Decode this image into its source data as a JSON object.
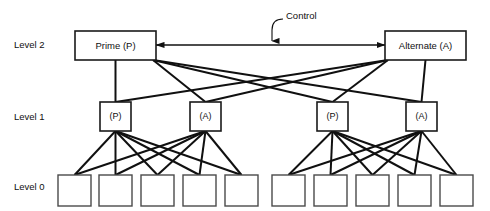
{
  "diagram": {
    "colors": {
      "line": "#101010",
      "box_stroke": "#1a1a1a",
      "leaf_stroke": "#4a4a4a",
      "background": "#ffffff",
      "text": "#101010"
    },
    "level_labels": [
      {
        "id": "level-2",
        "text": "Level 2",
        "x": 14,
        "y": 45
      },
      {
        "id": "level-1",
        "text": "Level 1",
        "x": 14,
        "y": 117
      },
      {
        "id": "level-0",
        "text": "Level 0",
        "x": 14,
        "y": 187
      }
    ],
    "annotations": [
      {
        "id": "control",
        "text": "Control",
        "x": 286,
        "y": 16
      }
    ],
    "level2_nodes": [
      {
        "id": "prime",
        "label": "Prime (P)",
        "x": 75,
        "y": 31,
        "w": 81,
        "h": 29
      },
      {
        "id": "alternate",
        "label": "Alternate (A)",
        "x": 385,
        "y": 31,
        "w": 81,
        "h": 29
      }
    ],
    "level1_nodes": [
      {
        "id": "l1-p-left",
        "label": "(P)",
        "x": 100,
        "y": 102,
        "w": 31,
        "h": 29
      },
      {
        "id": "l1-a-left",
        "label": "(A)",
        "x": 190,
        "y": 102,
        "w": 31,
        "h": 29
      },
      {
        "id": "l1-p-right",
        "label": "(P)",
        "x": 317,
        "y": 102,
        "w": 31,
        "h": 29
      },
      {
        "id": "l1-a-right",
        "label": "(A)",
        "x": 406,
        "y": 102,
        "w": 31,
        "h": 29
      }
    ],
    "level0_nodes": [
      {
        "id": "l0-1",
        "x": 58,
        "y": 175,
        "w": 33,
        "h": 31
      },
      {
        "id": "l0-2",
        "x": 99,
        "y": 175,
        "w": 33,
        "h": 31
      },
      {
        "id": "l0-3",
        "x": 141,
        "y": 175,
        "w": 33,
        "h": 31
      },
      {
        "id": "l0-4",
        "x": 183,
        "y": 175,
        "w": 33,
        "h": 31
      },
      {
        "id": "l0-5",
        "x": 225,
        "y": 175,
        "w": 33,
        "h": 31
      },
      {
        "id": "l0-6",
        "x": 272,
        "y": 175,
        "w": 33,
        "h": 31
      },
      {
        "id": "l0-7",
        "x": 314,
        "y": 175,
        "w": 33,
        "h": 31
      },
      {
        "id": "l0-8",
        "x": 356,
        "y": 175,
        "w": 33,
        "h": 31
      },
      {
        "id": "l0-9",
        "x": 398,
        "y": 175,
        "w": 33,
        "h": 31
      },
      {
        "id": "l0-10",
        "x": 440,
        "y": 175,
        "w": 33,
        "h": 31
      }
    ],
    "control_link": {
      "id": "control-bus",
      "x1": 156,
      "x2": 385,
      "y": 45,
      "double_headed": true
    },
    "control_leader": {
      "id": "control-leader",
      "path": "M 283 19 C 276 19 272 23 272 30 L 272 41",
      "arrow_tip": {
        "x": 272,
        "y": 45
      }
    },
    "edges_l2_l1": [
      {
        "from": "prime",
        "to": "l1-p-left"
      },
      {
        "from": "prime",
        "to": "l1-a-left"
      },
      {
        "from": "prime",
        "to": "l1-p-right"
      },
      {
        "from": "prime",
        "to": "l1-a-right"
      },
      {
        "from": "alternate",
        "to": "l1-p-left"
      },
      {
        "from": "alternate",
        "to": "l1-a-left"
      },
      {
        "from": "alternate",
        "to": "l1-p-right"
      },
      {
        "from": "alternate",
        "to": "l1-a-right"
      }
    ],
    "edges_l1_l0": [
      {
        "from": "l1-p-left",
        "to": "l0-1"
      },
      {
        "from": "l1-p-left",
        "to": "l0-2"
      },
      {
        "from": "l1-p-left",
        "to": "l0-3"
      },
      {
        "from": "l1-p-left",
        "to": "l0-4"
      },
      {
        "from": "l1-p-left",
        "to": "l0-5"
      },
      {
        "from": "l1-a-left",
        "to": "l0-1"
      },
      {
        "from": "l1-a-left",
        "to": "l0-2"
      },
      {
        "from": "l1-a-left",
        "to": "l0-3"
      },
      {
        "from": "l1-a-left",
        "to": "l0-4"
      },
      {
        "from": "l1-a-left",
        "to": "l0-5"
      },
      {
        "from": "l1-p-right",
        "to": "l0-6"
      },
      {
        "from": "l1-p-right",
        "to": "l0-7"
      },
      {
        "from": "l1-p-right",
        "to": "l0-8"
      },
      {
        "from": "l1-p-right",
        "to": "l0-9"
      },
      {
        "from": "l1-p-right",
        "to": "l0-10"
      },
      {
        "from": "l1-a-right",
        "to": "l0-6"
      },
      {
        "from": "l1-a-right",
        "to": "l0-7"
      },
      {
        "from": "l1-a-right",
        "to": "l0-8"
      },
      {
        "from": "l1-a-right",
        "to": "l0-9"
      },
      {
        "from": "l1-a-right",
        "to": "l0-10"
      }
    ]
  }
}
